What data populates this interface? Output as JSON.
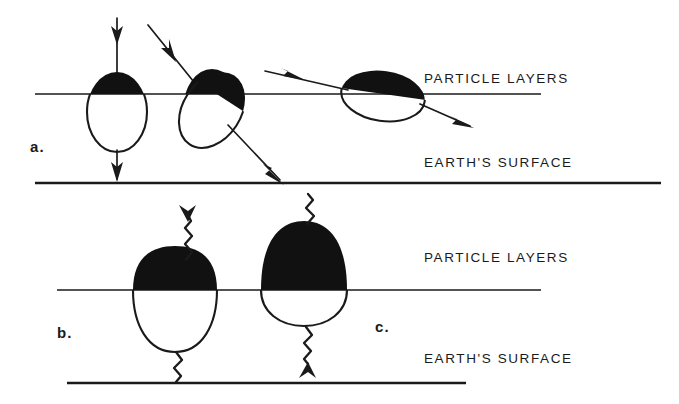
{
  "figure": {
    "background_color": "#ffffff",
    "ink_color": "#1a1a1a",
    "fill_color": "#111111",
    "width": 679,
    "height": 404
  },
  "panels": [
    {
      "id": "a",
      "label": "a.",
      "label_x": 30,
      "label_y": 152,
      "lines": [
        {
          "name": "particle-layers",
          "label": "PARTICLE LAYERS",
          "x1": 35,
          "x2": 541,
          "y": 94,
          "text_x": 424,
          "text_y": 83,
          "weight": "thin"
        },
        {
          "name": "earths-surface",
          "label": "EARTH'S SURFACE",
          "x1": 35,
          "x2": 661,
          "y": 183,
          "text_x": 424,
          "text_y": 167,
          "weight": "thick"
        }
      ],
      "events": [
        {
          "name": "vertical-transit",
          "blob_shape": "ellipse-vertical",
          "cx": 117,
          "cy": 112,
          "rx": 30,
          "ry": 40,
          "rotation": 0,
          "ray_in": {
            "x1": 117,
            "y1": 18,
            "x2": 117,
            "y2": 88
          },
          "ray_out": {
            "x1": 117,
            "y1": 150,
            "x2": 117,
            "y2": 180
          }
        },
        {
          "name": "oblique-transit",
          "blob_shape": "ellipse-tilted",
          "cx": 212,
          "cy": 110,
          "rx": 29,
          "ry": 41,
          "rotation": 33,
          "ray_in": {
            "x1": 148,
            "y1": 25,
            "x2": 199,
            "y2": 88
          },
          "ray_out": {
            "x1": 231,
            "y1": 128,
            "x2": 278,
            "y2": 180
          }
        },
        {
          "name": "grazing-transit",
          "blob_shape": "ellipse-horizontal",
          "cx": 383,
          "cy": 96,
          "rx": 42,
          "ry": 25,
          "rotation": 8,
          "ray_in": {
            "x1": 265,
            "y1": 71,
            "x2": 344,
            "y2": 89
          },
          "ray_out": {
            "x1": 421,
            "y1": 105,
            "x2": 468,
            "y2": 125
          }
        }
      ]
    },
    {
      "id": "b",
      "label": "b.",
      "label_x": 57,
      "label_y": 338,
      "lines": [
        {
          "name": "particle-layers",
          "label": "PARTICLE LAYERS",
          "x1": 57,
          "x2": 541,
          "y": 290,
          "text_x": 424,
          "text_y": 262,
          "weight": "thin"
        },
        {
          "name": "earths-surface",
          "label": "EARTH'S SURFACE",
          "x1": 67,
          "x2": 466,
          "y": 383,
          "text_x": 424,
          "text_y": 363,
          "weight": "thick"
        }
      ],
      "events": [
        {
          "name": "upward-wave-emission",
          "blob_shape": "dome-teardrop",
          "cx": 175,
          "top_y": 262,
          "bottom_y": 352,
          "half_width": 42,
          "wave_up": {
            "x": 190,
            "y1": 259,
            "y2": 214,
            "arrow": "up"
          },
          "wave_down": {
            "x": 176,
            "y1": 352,
            "y2": 382,
            "arrow": "none"
          }
        }
      ]
    },
    {
      "id": "c",
      "label": "c.",
      "label_x": 375,
      "label_y": 332,
      "events": [
        {
          "name": "downward-wave-emission",
          "blob_shape": "dome-tall",
          "cx": 304,
          "top_y": 221,
          "bottom_y": 326,
          "half_width": 43,
          "wave_up": {
            "x": 311,
            "y1": 221,
            "y2": 194,
            "arrow": "none"
          },
          "wave_down": {
            "x": 307,
            "y1": 326,
            "y2": 371,
            "arrow": "down"
          }
        }
      ]
    }
  ]
}
